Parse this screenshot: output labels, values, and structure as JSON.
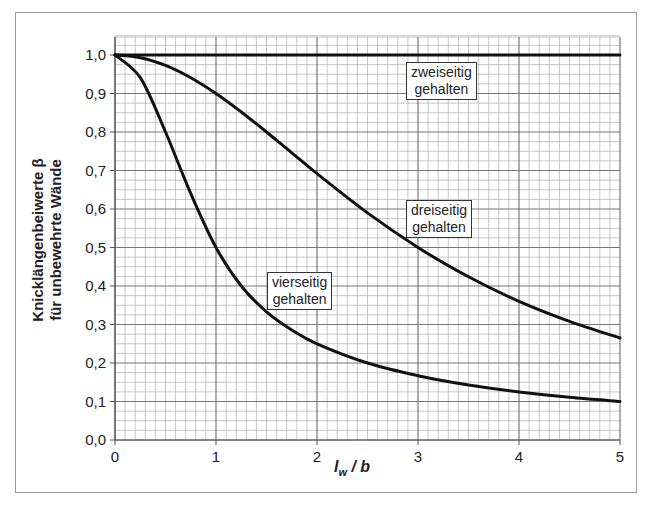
{
  "chart_data": {
    "type": "line",
    "title": "",
    "xlabel": "l_w / b",
    "xlabel_main": "l",
    "xlabel_sub": "w",
    "xlabel_rest": " / b",
    "ylabel_line1": "Knicklängenbeiwerte β",
    "ylabel_line2": "für unbewehrte Wände",
    "xlim": [
      0,
      5
    ],
    "ylim": [
      0,
      1.05
    ],
    "x_ticks": [
      "0",
      "1",
      "2",
      "3",
      "4",
      "5"
    ],
    "y_ticks": [
      "0,0",
      "0,1",
      "0,2",
      "0,3",
      "0,4",
      "0,5",
      "0,6",
      "0,7",
      "0,8",
      "0,9",
      "1,0"
    ],
    "grid": true,
    "x": [
      0,
      0.25,
      0.5,
      0.75,
      1.0,
      1.25,
      1.5,
      1.75,
      2.0,
      2.5,
      3.0,
      3.5,
      4.0,
      4.5,
      5.0
    ],
    "series": [
      {
        "name": "zweiseitig gehalten",
        "values": [
          1.0,
          1.0,
          1.0,
          1.0,
          1.0,
          1.0,
          1.0,
          1.0,
          1.0,
          1.0,
          1.0,
          1.0,
          1.0,
          1.0,
          1.0
        ]
      },
      {
        "name": "dreiseitig gehalten",
        "values": [
          1.0,
          0.993,
          0.973,
          0.941,
          0.9,
          0.852,
          0.8,
          0.746,
          0.692,
          0.59,
          0.5,
          0.424,
          0.36,
          0.308,
          0.265
        ]
      },
      {
        "name": "vierseitig gehalten",
        "values": [
          1.0,
          0.941,
          0.8,
          0.64,
          0.5,
          0.4,
          0.333,
          0.286,
          0.25,
          0.2,
          0.167,
          0.143,
          0.125,
          0.111,
          0.1
        ]
      }
    ],
    "annotations": [
      {
        "text_line1": "zweiseitig",
        "text_line2": "gehalten",
        "x": 3.1,
        "y": 0.93
      },
      {
        "text_line1": "dreiseitig",
        "text_line2": "gehalten",
        "x": 3.1,
        "y": 0.57
      },
      {
        "text_line1": "vierseitig",
        "text_line2": "gehalten",
        "x": 1.75,
        "y": 0.36
      }
    ],
    "legend_position": "inline-annotations"
  }
}
